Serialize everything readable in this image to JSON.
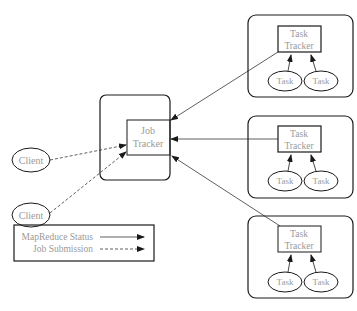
{
  "diagram": {
    "clients": [
      {
        "label": "Client"
      },
      {
        "label": "Client"
      }
    ],
    "job_tracker": {
      "line1": "Job",
      "line2": "Tracker"
    },
    "nodes": [
      {
        "tracker_line1": "Task",
        "tracker_line2": "Tracker",
        "tasks": [
          "Task",
          "Task"
        ]
      },
      {
        "tracker_line1": "Task",
        "tracker_line2": "Tracker",
        "tasks": [
          "Task",
          "Task"
        ]
      },
      {
        "tracker_line1": "Task",
        "tracker_line2": "Tracker",
        "tasks": [
          "Task",
          "Task"
        ]
      }
    ],
    "legend": {
      "status_label": "MapReduce Status",
      "submission_label": "Job Submission"
    },
    "colors": {
      "stroke": "#1a1a1a",
      "text": "#9a9a9a",
      "background": "#ffffff"
    }
  }
}
